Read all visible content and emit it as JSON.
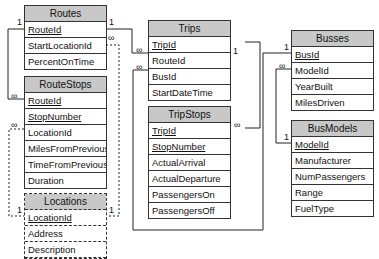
{
  "tables": {
    "routes": {
      "title": "Routes",
      "fields": [
        "RouteId",
        "StartLocationId",
        "PercentOnTime"
      ],
      "primary_keys": [
        "RouteId"
      ]
    },
    "routestops": {
      "title": "RouteStops",
      "fields": [
        "RouteId",
        "StopNumber",
        "LocationId",
        "MilesFromPrevious",
        "TimeFromPrevious",
        "Duration"
      ],
      "primary_keys": [
        "RouteId",
        "StopNumber"
      ]
    },
    "locations": {
      "title": "Locations",
      "fields": [
        "LocationId",
        "Address",
        "Description"
      ],
      "primary_keys": [
        "LocationId"
      ]
    },
    "trips": {
      "title": "Trips",
      "fields": [
        "TripId",
        "RouteId",
        "BusId",
        "StartDateTime"
      ],
      "primary_keys": [
        "TripId"
      ]
    },
    "tripstops": {
      "title": "TripStops",
      "fields": [
        "TripId",
        "StopNumber",
        "ActualArrival",
        "ActualDeparture",
        "PassengersOn",
        "PassengersOff"
      ],
      "primary_keys": [
        "TripId",
        "StopNumber"
      ]
    },
    "busses": {
      "title": "Busses",
      "fields": [
        "BusId",
        "ModelId",
        "YearBuilt",
        "MilesDriven"
      ],
      "primary_keys": [
        "BusId"
      ]
    },
    "busmodels": {
      "title": "BusModels",
      "fields": [
        "ModelId",
        "Manufacturer",
        "NumPassengers",
        "Range",
        "FuelType"
      ],
      "primary_keys": [
        "ModelId"
      ]
    }
  },
  "relationships": [
    {
      "from": "Routes.RouteId",
      "to": "RouteStops.RouteId",
      "from_card": "1",
      "to_card": "∞"
    },
    {
      "from": "Routes.RouteId",
      "to": "Trips.RouteId",
      "from_card": "1",
      "to_card": "∞"
    },
    {
      "from": "Locations.LocationId",
      "to": "Routes.StartLocationId",
      "from_card": "1",
      "to_card": "∞"
    },
    {
      "from": "Locations.LocationId",
      "to": "RouteStops.LocationId",
      "from_card": "1",
      "to_card": "∞"
    },
    {
      "from": "Trips.TripId",
      "to": "TripStops.TripId",
      "from_card": "1",
      "to_card": "∞"
    },
    {
      "from": "Busses.BusId",
      "to": "Trips.BusId",
      "from_card": "1",
      "to_card": "∞"
    },
    {
      "from": "BusModels.ModelId",
      "to": "Busses.ModelId",
      "from_card": "1",
      "to_card": "∞"
    }
  ],
  "labels": {
    "one": "1",
    "many": "∞"
  }
}
